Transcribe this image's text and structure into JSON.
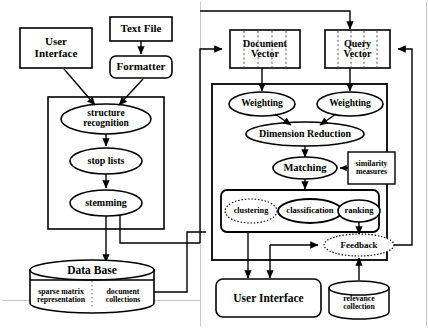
{
  "diagram": {
    "nodes": {
      "user_interface_top": "User\nInterface",
      "text_file": "Text File",
      "formatter": "Formatter",
      "structure_recognition": "structure\nrecognition",
      "stop_lists": "stop lists",
      "stemming": "stemming",
      "data_base": "Data Base",
      "sparse_matrix": "sparse matrix\nrepresentation",
      "document_collections": "document\ncollections",
      "document_vector": "Document\nVector",
      "query_vector": "Query\nVector",
      "weighting_left": "Weighting",
      "weighting_right": "Weighting",
      "dimension_reduction": "Dimension Reduction",
      "matching": "Matching",
      "similarity_measures": "similarity\nmeasures",
      "clustering": "clustering",
      "classification": "classification",
      "ranking": "ranking",
      "feedback": "Feedback",
      "user_interface_bottom": "User   Interface",
      "relevance_collection": "relevance\ncollection"
    },
    "colors": {
      "stroke": "#000000",
      "faint_boundary": "#bdbdbd",
      "background": "#ffffff"
    }
  }
}
